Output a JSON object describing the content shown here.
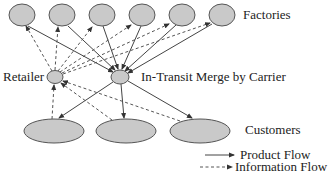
{
  "labels": {
    "factories": "Factories",
    "retailer": "Retailer",
    "merge": "In-Transit Merge by Carrier",
    "customers": "Customers"
  },
  "legend": {
    "product_flow": "Product Flow",
    "information_flow": "Information Flow"
  },
  "colors": {
    "node_fill": "#c9c9c9",
    "node_stroke": "#555555",
    "edge": "#444444"
  },
  "nodes": {
    "factories": [
      {
        "id": "factory-1",
        "cx": 22,
        "cy": 15
      },
      {
        "id": "factory-2",
        "cx": 62,
        "cy": 15
      },
      {
        "id": "factory-3",
        "cx": 102,
        "cy": 15
      },
      {
        "id": "factory-4",
        "cx": 142,
        "cy": 15
      },
      {
        "id": "factory-5",
        "cx": 182,
        "cy": 15
      },
      {
        "id": "factory-6",
        "cx": 222,
        "cy": 15
      }
    ],
    "retailer": {
      "cx": 55,
      "cy": 77
    },
    "merge": {
      "cx": 120,
      "cy": 77
    },
    "customers": [
      {
        "id": "customer-1",
        "cx": 54,
        "cy": 131
      },
      {
        "id": "customer-2",
        "cx": 126,
        "cy": 131
      },
      {
        "id": "customer-3",
        "cx": 200,
        "cy": 131
      }
    ]
  },
  "edges": {
    "product_flow": "factories → merge; merge → customers",
    "information_flow": "retailer → factories; retailer ← customers; merge ↔ customers"
  }
}
